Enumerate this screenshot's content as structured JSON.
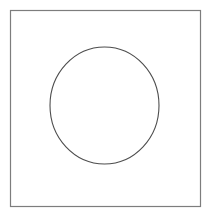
{
  "figure": {
    "title": "Circle inscribed in a square outline",
    "canvas": {
      "width": 211,
      "height": 217,
      "background_color": "#ffffff"
    },
    "shapes": [
      {
        "name": "square-outline",
        "type": "rectangle",
        "x": 10.5,
        "y": 10.5,
        "width": 190,
        "height": 196,
        "stroke_color": "#7d7d7d",
        "stroke_width": 1.2,
        "fill": "none"
      },
      {
        "name": "circle-outline",
        "type": "ellipse",
        "cx": 104.5,
        "cy": 105.5,
        "rx": 54.5,
        "ry": 58.5,
        "stroke_color": "#4d4d4d",
        "stroke_width": 1.1,
        "fill": "none"
      }
    ]
  }
}
